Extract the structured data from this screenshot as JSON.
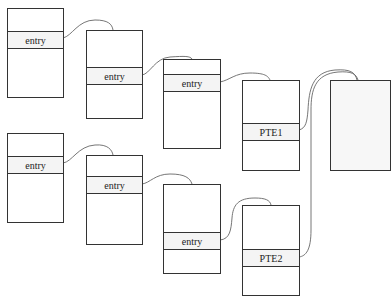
{
  "diagram": {
    "type": "page-table-walk",
    "rows": [
      {
        "name": "walk-1",
        "boxes": [
          {
            "label": "entry"
          },
          {
            "label": "entry"
          },
          {
            "label": "entry"
          },
          {
            "label": "PTE1"
          }
        ]
      },
      {
        "name": "walk-2",
        "boxes": [
          {
            "label": "entry"
          },
          {
            "label": "entry"
          },
          {
            "label": "entry"
          },
          {
            "label": "PTE2"
          }
        ]
      }
    ],
    "shared_page": {
      "label": ""
    },
    "colors": {
      "border": "#333333",
      "row_fill": "#f4f4f4",
      "page_fill": "#f7f7f7",
      "link": "#555555"
    }
  }
}
